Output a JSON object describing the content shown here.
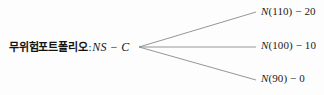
{
  "diagram": {
    "type": "payoff-tree",
    "background_color": "#fdfdfd",
    "line_color": "#8a8a8a",
    "text_color": "#1a1a1a",
    "root": {
      "korean_text": "무위험포트폴리오",
      "separator": ":",
      "expression": "NS − C"
    },
    "vertex": {
      "x": 139,
      "y": 47
    },
    "branches": [
      {
        "name": "up",
        "x1": 139,
        "y1": 47,
        "x2": 256,
        "y2": 12
      },
      {
        "name": "middle",
        "x1": 139,
        "y1": 47,
        "x2": 256,
        "y2": 47
      },
      {
        "name": "down",
        "x1": 139,
        "y1": 47,
        "x2": 256,
        "y2": 80
      }
    ],
    "leaves": [
      {
        "name": "up",
        "function": "N",
        "argument": "(110)",
        "operator": "−",
        "value": "20",
        "text": "N(110) − 20"
      },
      {
        "name": "middle",
        "function": "N",
        "argument": "(100)",
        "operator": "−",
        "value": "10",
        "text": "N(100) − 10"
      },
      {
        "name": "down",
        "function": "N",
        "argument": "(90)",
        "operator": "−",
        "value": "0",
        "text": "N(90) − 0"
      }
    ]
  }
}
